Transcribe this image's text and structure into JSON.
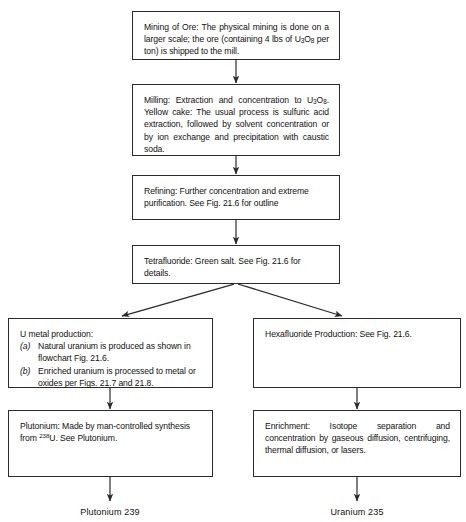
{
  "diagram": {
    "line_color": "#2b2b2b",
    "background": "#ffffff",
    "nodes": [
      {
        "id": "mining",
        "name": "mining-of-ore",
        "lines": [
          "Mining of Ore:  The physical mining is done on a larger scale; the ore (containing 4 lbs of ",
          " per ton) is shipped to the mill."
        ],
        "heading": "Mining of Ore:",
        "formula": "U3O8",
        "text_a": "Mining of Ore:  The physical mining is done on a larger scale; the ore (containing 4 lbs of ",
        "text_b": " per ton) is shipped to the mill."
      },
      {
        "id": "milling",
        "name": "milling",
        "text_a": "Milling: Extraction and concentration to ",
        "formula": "U3O8",
        "text_b": ". Yellow cake: The usual process is sulfuric acid extraction, followed by solvent concentration or by ion exchange and precipitation with caustic soda."
      },
      {
        "id": "refining",
        "name": "refining",
        "text": "Refining:  Further concentration and extreme purification.  See Fig. 21.6 for outline"
      },
      {
        "id": "tetrafluoride",
        "name": "tetrafluoride",
        "text": "Tetrafluoride:  Green salt. See Fig. 21.6 for details."
      },
      {
        "id": "umetal",
        "name": "u-metal-production",
        "heading": "U metal production:",
        "items": [
          {
            "marker": "(a)",
            "text": "Natural uranium is produced as shown in flowchart Fig. 21.6."
          },
          {
            "marker": "(b)",
            "text": "Enriched uranium is processed to metal or oxides per Figs. 21.7 and 21.8."
          }
        ]
      },
      {
        "id": "hexafluoride",
        "name": "hexafluoride-production",
        "text": "Hexafluoride Production:  See Fig. 21.6."
      },
      {
        "id": "plutonium",
        "name": "plutonium",
        "text_a": "Plutonium: Made by man-controlled synthesis from ",
        "superscript": "238",
        "text_b": "U. See Plutonium."
      },
      {
        "id": "enrichment",
        "name": "enrichment",
        "text": "Enrichment:  Isotope separation and concentration by gaseous diffusion, centrifuging, thermal diffusion, or lasers."
      }
    ],
    "end_labels": [
      {
        "id": "pu239",
        "name": "plutonium-239-output",
        "text": "Plutonium 239"
      },
      {
        "id": "u235",
        "name": "uranium-235-output",
        "text": "Uranium 235"
      }
    ],
    "formula_parts": {
      "u3o8_u": "U",
      "u3o8_3": "3",
      "u3o8_o": "O",
      "u3o8_8": "8"
    }
  }
}
